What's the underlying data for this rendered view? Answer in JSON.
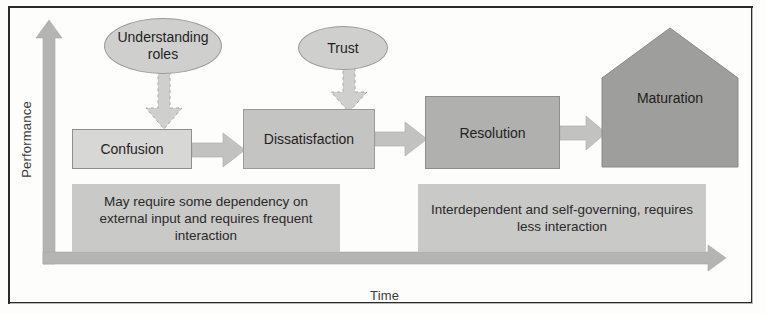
{
  "diagram": {
    "axes": {
      "y_label": "Performance",
      "x_label": "Time"
    },
    "stages": [
      {
        "id": "confusion",
        "label": "Confusion",
        "shape": "rectangle",
        "fill": "#d7d7d5"
      },
      {
        "id": "dissatisfaction",
        "label": "Dissatisfaction",
        "shape": "rectangle",
        "fill": "#c4c4c2"
      },
      {
        "id": "resolution",
        "label": "Resolution",
        "shape": "rectangle",
        "fill": "#b0b0ae"
      },
      {
        "id": "maturation",
        "label": "Maturation",
        "shape": "pentagon",
        "fill": "#9e9e9c"
      }
    ],
    "influences": [
      {
        "id": "understanding-roles",
        "label": "Understanding roles",
        "shape": "ellipse",
        "points_to": "confusion"
      },
      {
        "id": "trust",
        "label": "Trust",
        "shape": "ellipse",
        "points_to": "dissatisfaction"
      }
    ],
    "captions": [
      {
        "id": "caption-left",
        "text": "May require some dependency on external input and requires frequent interaction"
      },
      {
        "id": "caption-right",
        "text": "Interdependent and self-governing, requires less interaction"
      }
    ],
    "colors": {
      "frame": "#2b2b2b",
      "axis_arrow": "#b4b4b2",
      "caption_panel": "#c9c9c7",
      "flow_arrow": "#c2c2c0",
      "dashed_arrow": "#c2c2c0",
      "background": "#fdfdfc"
    }
  }
}
